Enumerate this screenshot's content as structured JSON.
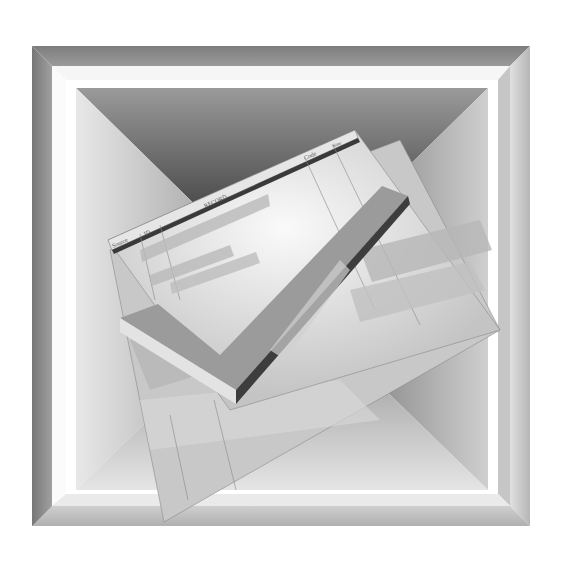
{
  "illustration": {
    "subject": "Spreadsheet record with checkmark inside a beveled frame",
    "frame_color": "#8a8a8a",
    "frame_highlight": "#f4f4f4",
    "sheet_color": "#d8d8d8",
    "check_color": "#9a9a9a"
  },
  "sheet": {
    "headers": [
      "Source",
      "ID",
      "RECORD",
      "Code",
      "Note"
    ]
  }
}
